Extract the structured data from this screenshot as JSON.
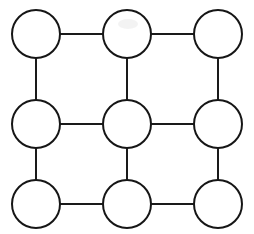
{
  "diagram": {
    "type": "node-link-diagram",
    "background_color": "#ffffff",
    "node_fill_color": "#ffffff",
    "node_stroke_color": "#161616",
    "edge_stroke_color": "#1a1a1a",
    "node_stroke_width": 2,
    "edge_stroke_width": 2,
    "node_radius": 24,
    "grid": {
      "rows": 3,
      "columns": 3,
      "column_centers_x": [
        36,
        127,
        218
      ],
      "row_centers_y": [
        34,
        124,
        204
      ]
    },
    "nodes": [
      {
        "id": "r1c1",
        "label": "",
        "row": 1,
        "col": 1,
        "cx": 36,
        "cy": 34,
        "r": 24
      },
      {
        "id": "r1c2",
        "label": "",
        "row": 1,
        "col": 2,
        "cx": 127,
        "cy": 34,
        "r": 24
      },
      {
        "id": "r1c3",
        "label": "",
        "row": 1,
        "col": 3,
        "cx": 218,
        "cy": 34,
        "r": 24
      },
      {
        "id": "r2c1",
        "label": "",
        "row": 2,
        "col": 1,
        "cx": 36,
        "cy": 124,
        "r": 24
      },
      {
        "id": "r2c2",
        "label": "",
        "row": 2,
        "col": 2,
        "cx": 127,
        "cy": 124,
        "r": 24
      },
      {
        "id": "r2c3",
        "label": "",
        "row": 2,
        "col": 3,
        "cx": 218,
        "cy": 124,
        "r": 24
      },
      {
        "id": "r3c1",
        "label": "",
        "row": 3,
        "col": 1,
        "cx": 36,
        "cy": 204,
        "r": 24
      },
      {
        "id": "r3c2",
        "label": "",
        "row": 3,
        "col": 2,
        "cx": 127,
        "cy": 204,
        "r": 24
      },
      {
        "id": "r3c3",
        "label": "",
        "row": 3,
        "col": 3,
        "cx": 218,
        "cy": 204,
        "r": 24
      }
    ],
    "edges": [
      {
        "id": "e-r1c1-r1c2",
        "from": "r1c1",
        "to": "r1c2",
        "orientation": "horizontal",
        "x1": 60,
        "y1": 34,
        "x2": 103,
        "y2": 34
      },
      {
        "id": "e-r1c2-r1c3",
        "from": "r1c2",
        "to": "r1c3",
        "orientation": "horizontal",
        "x1": 151,
        "y1": 34,
        "x2": 194,
        "y2": 34
      },
      {
        "id": "e-r2c1-r2c2",
        "from": "r2c1",
        "to": "r2c2",
        "orientation": "horizontal",
        "x1": 60,
        "y1": 124,
        "x2": 103,
        "y2": 124
      },
      {
        "id": "e-r2c2-r2c3",
        "from": "r2c2",
        "to": "r2c3",
        "orientation": "horizontal",
        "x1": 151,
        "y1": 124,
        "x2": 194,
        "y2": 124
      },
      {
        "id": "e-r3c1-r3c2",
        "from": "r3c1",
        "to": "r3c2",
        "orientation": "horizontal",
        "x1": 60,
        "y1": 204,
        "x2": 103,
        "y2": 204
      },
      {
        "id": "e-r3c2-r3c3",
        "from": "r3c2",
        "to": "r3c3",
        "orientation": "horizontal",
        "x1": 151,
        "y1": 204,
        "x2": 194,
        "y2": 204
      },
      {
        "id": "e-r1c1-r2c1",
        "from": "r1c1",
        "to": "r2c1",
        "orientation": "vertical",
        "x1": 36,
        "y1": 58,
        "x2": 36,
        "y2": 100
      },
      {
        "id": "e-r1c2-r2c2",
        "from": "r1c2",
        "to": "r2c2",
        "orientation": "vertical",
        "x1": 127,
        "y1": 58,
        "x2": 127,
        "y2": 100
      },
      {
        "id": "e-r1c3-r2c3",
        "from": "r1c3",
        "to": "r2c3",
        "orientation": "vertical",
        "x1": 218,
        "y1": 58,
        "x2": 218,
        "y2": 100
      },
      {
        "id": "e-r2c1-r3c1",
        "from": "r2c1",
        "to": "r3c1",
        "orientation": "vertical",
        "x1": 36,
        "y1": 148,
        "x2": 36,
        "y2": 180
      },
      {
        "id": "e-r2c2-r3c2",
        "from": "r2c2",
        "to": "r3c2",
        "orientation": "vertical",
        "x1": 127,
        "y1": 148,
        "x2": 127,
        "y2": 180
      },
      {
        "id": "e-r2c3-r3c3",
        "from": "r2c3",
        "to": "r3c3",
        "orientation": "vertical",
        "x1": 218,
        "y1": 148,
        "x2": 218,
        "y2": 180
      }
    ],
    "artifact": {
      "id": "top-middle-smudge",
      "description": "faint light-gray mark inside top-middle node",
      "cx": 128,
      "cy": 24,
      "rx": 10,
      "ry": 5,
      "color": "#e9e9e9"
    }
  }
}
